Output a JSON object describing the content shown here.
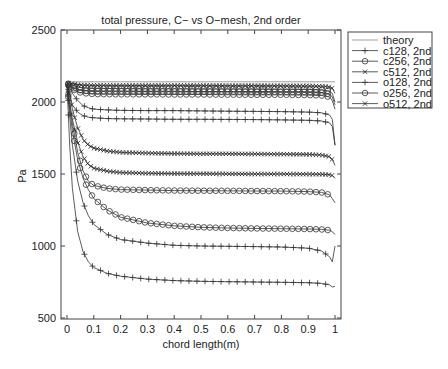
{
  "chart_data": {
    "type": "line",
    "title": "total pressure, C− vs O−mesh, 2nd order",
    "xlabel": "chord length(m)",
    "ylabel": "Pa",
    "xlim": [
      -0.03,
      1.02
    ],
    "ylim": [
      500,
      2500
    ],
    "xticks": [
      "0",
      "0.1",
      "0.2",
      "0.3",
      "0.4",
      "0.5",
      "0.6",
      "0.7",
      "0.8",
      "0.9",
      "1"
    ],
    "yticks": [
      "500",
      "1000",
      "1500",
      "2000",
      "2500"
    ],
    "grid": false,
    "legend_position": "outside-right-top",
    "x": [
      0.0,
      0.01,
      0.02,
      0.04,
      0.06,
      0.08,
      0.1,
      0.15,
      0.2,
      0.3,
      0.4,
      0.5,
      0.6,
      0.7,
      0.8,
      0.9,
      0.95,
      0.98,
      0.99,
      1.0
    ],
    "series": [
      {
        "name": "theory",
        "marker": "none",
        "values": [
          2140,
          2140,
          2140,
          2140,
          2140,
          2140,
          2140,
          2140,
          2140,
          2140,
          2140,
          2140,
          2140,
          2140,
          2140,
          2140,
          2140,
          2140,
          2140,
          2140
        ]
      },
      {
        "name": "c128, 2nd",
        "marker": "+",
        "values": [
          2120,
          2100,
          2060,
          2010,
          1975,
          1960,
          1950,
          1945,
          1942,
          1940,
          1940,
          1938,
          1936,
          1935,
          1933,
          1930,
          1925,
          1910,
          1880,
          1700
        ]
      },
      {
        "name": "c256, 2nd",
        "marker": "o",
        "values": [
          2130,
          2125,
          2115,
          2105,
          2100,
          2097,
          2095,
          2094,
          2093,
          2092,
          2092,
          2091,
          2090,
          2090,
          2089,
          2088,
          2085,
          2075,
          2060,
          2000
        ]
      },
      {
        "name": "c512, 2nd",
        "marker": "x",
        "values": [
          2130,
          2128,
          2125,
          2120,
          2118,
          2117,
          2116,
          2115,
          2115,
          2115,
          2115,
          2115,
          2114,
          2114,
          2113,
          2112,
          2110,
          2105,
          2095,
          2060
        ]
      },
      {
        "name": "o128, 2nd",
        "marker": "+",
        "values": [
          2120,
          1900,
          1700,
          1450,
          1300,
          1210,
          1150,
          1080,
          1045,
          1020,
          1005,
          1000,
          998,
          996,
          993,
          985,
          965,
          925,
          890,
          1000
        ]
      },
      {
        "name": "o256, 2nd",
        "marker": "o",
        "values": [
          2120,
          1950,
          1800,
          1600,
          1470,
          1390,
          1330,
          1250,
          1200,
          1160,
          1140,
          1130,
          1125,
          1122,
          1120,
          1118,
          1115,
          1110,
          1100,
          1080
        ]
      },
      {
        "name": "o512, 2nd",
        "marker": "x",
        "values": [
          2125,
          2050,
          1950,
          1820,
          1740,
          1700,
          1680,
          1660,
          1650,
          1645,
          1642,
          1640,
          1640,
          1639,
          1638,
          1636,
          1632,
          1620,
          1600,
          1560
        ]
      }
    ],
    "extra_curves": [
      {
        "marker": "+",
        "values": [
          2120,
          1700,
          1400,
          1100,
          960,
          890,
          850,
          810,
          790,
          770,
          760,
          755,
          752,
          750,
          748,
          745,
          740,
          730,
          715,
          720
        ]
      },
      {
        "marker": "+",
        "values": [
          2125,
          2050,
          1980,
          1930,
          1905,
          1895,
          1890,
          1885,
          1883,
          1882,
          1880,
          1880,
          1879,
          1878,
          1876,
          1873,
          1868,
          1855,
          1830,
          1700
        ]
      },
      {
        "marker": "x",
        "values": [
          2125,
          2000,
          1880,
          1720,
          1620,
          1565,
          1540,
          1520,
          1510,
          1505,
          1503,
          1502,
          1501,
          1500,
          1500,
          1499,
          1498,
          1495,
          1490,
          1470
        ]
      },
      {
        "marker": "o",
        "values": [
          2125,
          1980,
          1850,
          1650,
          1520,
          1450,
          1420,
          1400,
          1392,
          1388,
          1385,
          1384,
          1383,
          1382,
          1381,
          1378,
          1372,
          1355,
          1330,
          1300
        ]
      },
      {
        "marker": "o",
        "values": [
          2128,
          2110,
          2090,
          2070,
          2062,
          2058,
          2055,
          2054,
          2053,
          2053,
          2052,
          2052,
          2051,
          2050,
          2050,
          2048,
          2045,
          2035,
          2010,
          1950
        ]
      },
      {
        "marker": "o",
        "values": [
          2128,
          2115,
          2100,
          2085,
          2080,
          2077,
          2076,
          2075,
          2075,
          2074,
          2074,
          2073,
          2073,
          2072,
          2071,
          2070,
          2066,
          2055,
          2035,
          1980
        ]
      }
    ]
  },
  "legend": [
    {
      "label": "theory",
      "marker": "none"
    },
    {
      "label": "c128, 2nd",
      "marker": "+"
    },
    {
      "label": "c256, 2nd",
      "marker": "o"
    },
    {
      "label": "c512, 2nd",
      "marker": "x"
    },
    {
      "label": "o128, 2nd",
      "marker": "+"
    },
    {
      "label": "o256, 2nd",
      "marker": "o"
    },
    {
      "label": "o512, 2nd",
      "marker": "x"
    }
  ]
}
